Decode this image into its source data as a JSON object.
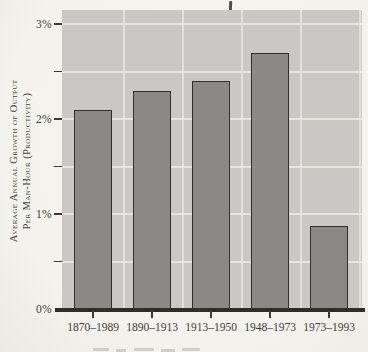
{
  "figure": {
    "y_axis_title_line1": "Average Annual Growth of Output",
    "y_axis_title_line2": "Per Man-Hour (Productivity)"
  },
  "chart_data": {
    "type": "bar",
    "categories": [
      "1870–1989",
      "1890–1913",
      "1913–1950",
      "1948–1973",
      "1973–1993"
    ],
    "values": [
      2.1,
      2.3,
      2.4,
      2.7,
      0.87
    ],
    "title": "",
    "xlabel": "",
    "ylabel": "Average Annual Growth of Output per Man-Hour (Productivity)",
    "yticks": [
      {
        "label": "0%",
        "value": 0
      },
      {
        "label": "1%",
        "value": 1
      },
      {
        "label": "2%",
        "value": 2
      },
      {
        "label": "3%",
        "value": 3
      }
    ],
    "minor_ticks": [
      0.5,
      1.5,
      2.5
    ],
    "gridline_levels": [
      0.5,
      1.0,
      1.5,
      2.0,
      2.5,
      3.0
    ],
    "ylim": [
      0,
      3.15
    ],
    "grid": true,
    "legend": "none",
    "colors": {
      "paper": "#f4f3ee",
      "plot_background": "#c9c8c4",
      "bar_fill": "#8a8985",
      "bar_border": "#31302c",
      "gridline": "#eceae5",
      "axis": "#2e2d28",
      "text": "#3e3c35"
    }
  }
}
